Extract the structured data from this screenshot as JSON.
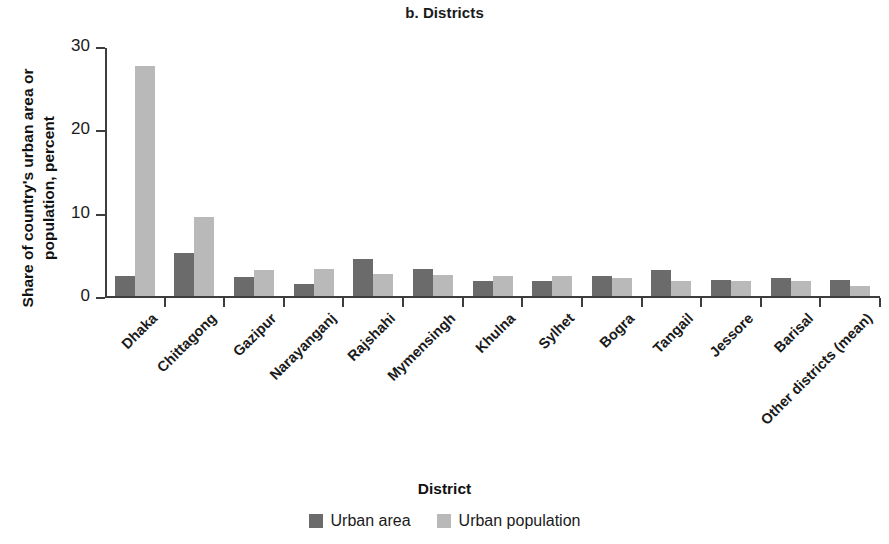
{
  "chart_data": {
    "type": "bar",
    "title": "b. Districts",
    "xlabel": "District",
    "ylabel": "Share of country's urban area or population, percent",
    "ylabel_lines": [
      "Share of country's urban area or",
      "population, percent"
    ],
    "ylim": [
      0,
      30
    ],
    "yticks": [
      0,
      10,
      20,
      30
    ],
    "ytick_labels": [
      "0",
      "10",
      "20",
      "30"
    ],
    "grid": false,
    "legend_position": "bottom",
    "categories": [
      "Dhaka",
      "Chittagong",
      "Gazipur",
      "Narayanganj",
      "Rajshahi",
      "Mymensingh",
      "Khulna",
      "Sylhet",
      "Bogra",
      "Tangail",
      "Jessore",
      "Barisal",
      "Other districts (mean)"
    ],
    "series": [
      {
        "name": "Urban area",
        "color": "#6b6b6b",
        "values": [
          2.4,
          5.2,
          2.3,
          1.5,
          4.4,
          3.2,
          1.8,
          1.8,
          2.4,
          3.1,
          1.9,
          2.2,
          1.9
        ]
      },
      {
        "name": "Urban population",
        "color": "#b9b9b9",
        "values": [
          27.6,
          9.5,
          3.1,
          3.2,
          2.7,
          2.5,
          2.4,
          2.4,
          2.2,
          1.8,
          1.8,
          1.8,
          1.2
        ]
      }
    ]
  }
}
